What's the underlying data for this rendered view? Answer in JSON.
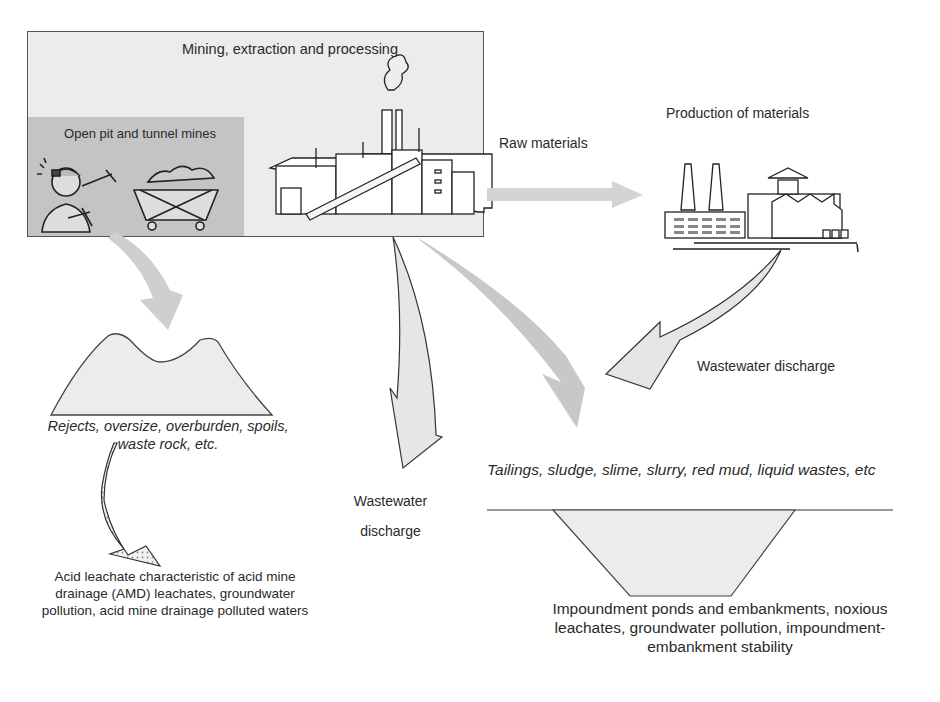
{
  "diagram": {
    "nodes": {
      "mining": {
        "label": "Mining, extraction and processing"
      },
      "open_pit": {
        "label": "Open pit  and tunnel mines"
      },
      "production": {
        "label": "Production of materials"
      },
      "rejects": {
        "label": "Rejects, oversize, overburden, spoils, waste rock, etc."
      },
      "acid": {
        "label": "Acid leachate characteristic of acid mine drainage (AMD) leachates, groundwater pollution, acid mine drainage polluted waters"
      },
      "tailings": {
        "label": "Tailings, sludge, slime, slurry, red mud,  liquid wastes, etc"
      },
      "impoundment": {
        "label": "Impoundment ponds and embankments, noxious leachates, groundwater pollution, impoundment-embankment stability"
      }
    },
    "edges": {
      "raw_materials": {
        "label": "Raw materials",
        "from": "mining",
        "to": "production"
      },
      "wastewater_mid": {
        "label": "Wastewater discharge",
        "from": "mining",
        "to": "down"
      },
      "wastewater_right": {
        "label": "Wastewater discharge",
        "from": "production",
        "to": "tailings"
      },
      "mining_to_rejects": {
        "from": "open_pit",
        "to": "rejects"
      },
      "mining_to_tailings": {
        "from": "mining",
        "to": "tailings"
      },
      "rejects_to_acid": {
        "from": "rejects",
        "to": "acid"
      }
    },
    "icons": [
      "miner-icon",
      "mine-cart-icon",
      "processing-plant-icon",
      "factory-icon",
      "waste-heap-icon",
      "impoundment-pond-icon"
    ],
    "colors": {
      "box_fill": "#ececec",
      "inner_box_fill": "#c4c4c4",
      "arrow_fill": "#d4d4d4",
      "outline": "#555555"
    }
  }
}
